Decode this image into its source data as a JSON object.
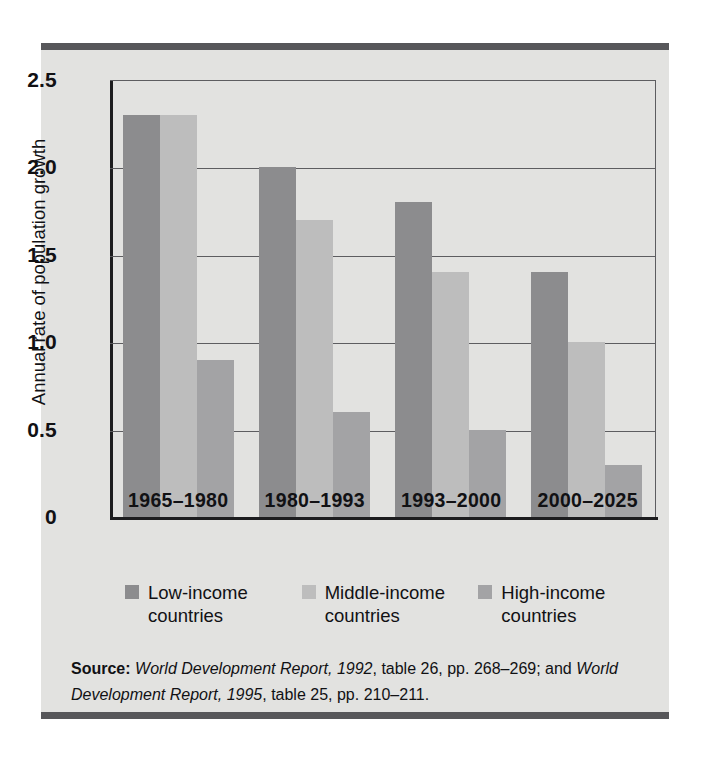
{
  "chart_data": {
    "type": "bar",
    "title": "",
    "xlabel": "",
    "ylabel": "Annual rate of population growth",
    "ylim": [
      0,
      2.5
    ],
    "yticks": [
      "0",
      "0.5",
      "1.0",
      "1.5",
      "2.0",
      "2.5"
    ],
    "ytick_values": [
      0,
      0.5,
      1.0,
      1.5,
      2.0,
      2.5
    ],
    "grid": true,
    "legend_position": "bottom",
    "categories": [
      "1965–1980",
      "1980–1993",
      "1993–2000",
      "2000–2025"
    ],
    "series": [
      {
        "name": "Low-income countries",
        "color": "#8c8c8e",
        "values": [
          2.3,
          2.0,
          1.8,
          1.4
        ]
      },
      {
        "name": "Middle-income countries",
        "color": "#bdbdbd",
        "values": [
          2.3,
          1.7,
          1.4,
          1.0
        ]
      },
      {
        "name": "High-income countries",
        "color": "#a3a3a5",
        "values": [
          0.9,
          0.6,
          0.5,
          0.3
        ]
      }
    ]
  },
  "legend": [
    {
      "line1": "Low-income",
      "line2": "countries"
    },
    {
      "line1": "Middle-income",
      "line2": "countries"
    },
    {
      "line1": "High-income",
      "line2": "countries"
    }
  ],
  "source": {
    "label": "Source:",
    "ref1_title": "World Development Report, 1992",
    "ref1_detail": ", table 26, pp. 268–269; and ",
    "ref2_title": "World Development Report, 1995",
    "ref2_detail": ", table 25, pp. 210–211."
  },
  "colors": {
    "panel": "#e2e2e0",
    "rule": "#57575a",
    "axis": "#1d1d1f",
    "gridline": "#5d5d60"
  }
}
